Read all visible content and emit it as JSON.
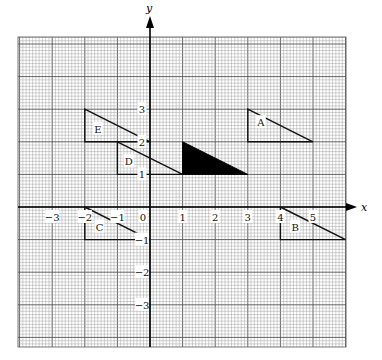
{
  "diagram": {
    "type": "coordinate-grid-transformations",
    "axes": {
      "x_label": "x",
      "y_label": "y",
      "x_ticks": [
        {
          "value": -3,
          "label": "−3"
        },
        {
          "value": -2,
          "label": "−2"
        },
        {
          "value": -1,
          "label": "−1"
        },
        {
          "value": 0,
          "label": "0"
        },
        {
          "value": 1,
          "label": "1"
        },
        {
          "value": 2,
          "label": "2"
        },
        {
          "value": 3,
          "label": "3"
        },
        {
          "value": 4,
          "label": "4"
        },
        {
          "value": 5,
          "label": "5"
        }
      ],
      "y_ticks": [
        {
          "value": 3,
          "label": "3"
        },
        {
          "value": 2,
          "label": "2"
        },
        {
          "value": 1,
          "label": "1"
        },
        {
          "value": -1,
          "label": "−1"
        },
        {
          "value": -2,
          "label": "−2"
        },
        {
          "value": -3,
          "label": "−3"
        }
      ]
    },
    "shaded_triangle": {
      "name": "original",
      "vertices": [
        [
          1,
          2
        ],
        [
          1,
          1
        ],
        [
          3,
          1
        ]
      ],
      "fill": "#000000"
    },
    "triangles": [
      {
        "label": "A",
        "vertices": [
          [
            3,
            3
          ],
          [
            3,
            2
          ],
          [
            5,
            2
          ]
        ],
        "label_pos": [
          3.4,
          2.6
        ]
      },
      {
        "label": "B",
        "vertices": [
          [
            4,
            0
          ],
          [
            4,
            -1
          ],
          [
            6,
            -1
          ]
        ],
        "label_pos": [
          4.45,
          -0.6
        ]
      },
      {
        "label": "C",
        "vertices": [
          [
            -2,
            0
          ],
          [
            -2,
            -1
          ],
          [
            0,
            -1
          ]
        ],
        "label_pos": [
          -1.55,
          -0.6
        ]
      },
      {
        "label": "D",
        "vertices": [
          [
            -1,
            2
          ],
          [
            -1,
            1
          ],
          [
            1,
            1
          ]
        ],
        "label_pos": [
          -0.65,
          1.4
        ]
      },
      {
        "label": "E",
        "vertices": [
          [
            -2,
            3
          ],
          [
            -2,
            2
          ],
          [
            0,
            2
          ]
        ],
        "label_pos": [
          -1.6,
          2.4
        ]
      }
    ],
    "colors": {
      "grid_minor": "#9a9a9a",
      "grid_major": "#555555",
      "axis": "#000000",
      "outline": "#111111"
    }
  }
}
